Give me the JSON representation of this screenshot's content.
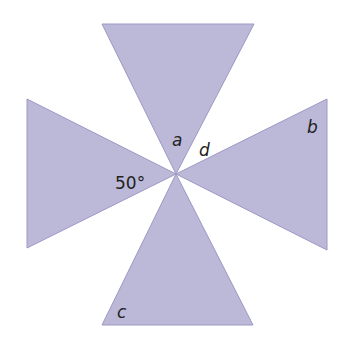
{
  "diagram": {
    "colors": {
      "fill": "#bcb8d8",
      "stroke": "#9d98c4",
      "text": "#222222"
    },
    "labels": {
      "angle_given": "50°",
      "a": "a",
      "b": "b",
      "c": "c",
      "d": "d"
    }
  }
}
